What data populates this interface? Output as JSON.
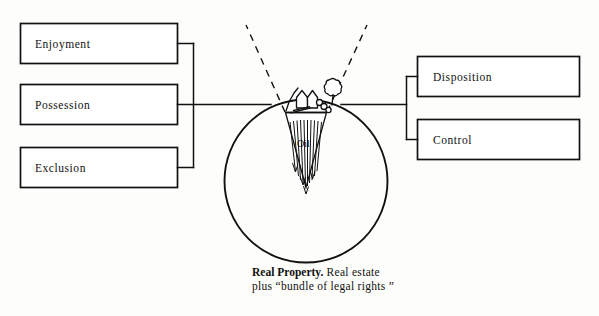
{
  "figure": {
    "title": "Real Property",
    "left_group": {
      "items": [
        {
          "label": "Enjoyment"
        },
        {
          "label": "Possession"
        },
        {
          "label": "Exclusion"
        }
      ]
    },
    "right_group": {
      "items": [
        {
          "label": "Disposition"
        },
        {
          "label": "Control"
        }
      ]
    },
    "center": {
      "subsurface_label": "Oil",
      "scene_icons": [
        "house-icon",
        "tree-icon",
        "shrub-icon"
      ]
    },
    "caption": {
      "bold_text": "Real Property.",
      "line1_rest": " Real estate",
      "line2": "plus “bundle of legal rights ”"
    },
    "colors": {
      "ink": "#111111",
      "paper": "#fdfdfb",
      "node_fill": "#ffffff"
    }
  }
}
